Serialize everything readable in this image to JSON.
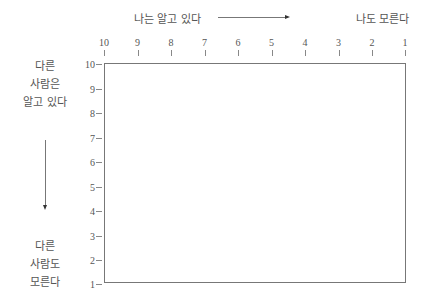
{
  "top_labels": {
    "left": "나는 알고 있다",
    "right": "나도 모른다"
  },
  "left_labels": {
    "top": [
      "다른",
      "사람은",
      "알고 있다"
    ],
    "bottom": [
      "다른",
      "사람도",
      "모른다"
    ]
  },
  "x_axis": {
    "ticks": [
      "10",
      "9",
      "8",
      "7",
      "6",
      "5",
      "4",
      "3",
      "2",
      "1"
    ]
  },
  "y_axis": {
    "ticks": [
      "10",
      "9",
      "8",
      "7",
      "6",
      "5",
      "4",
      "3",
      "2",
      "1"
    ]
  },
  "arrows": {
    "horizontal": "right-arrow-icon",
    "vertical": "down-arrow-icon"
  },
  "colors": {
    "line": "#777777",
    "text": "#555555"
  }
}
